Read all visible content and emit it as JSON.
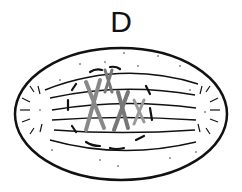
{
  "diagram": {
    "label": "D",
    "colors": {
      "outline": "#111111",
      "chromosome_dark": "#777777",
      "chromosome_light": "#999999",
      "background": "#ffffff"
    }
  }
}
